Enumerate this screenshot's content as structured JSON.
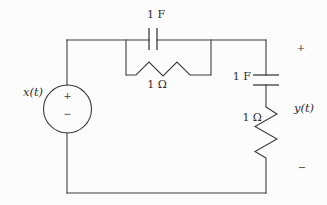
{
  "figure": {
    "kind": "circuit-diagram",
    "colors": {
      "line": "#3c3c3c",
      "background": "#fcfcfc",
      "text": "#2f2f2f"
    },
    "source": {
      "label": "x(t)",
      "plus": "+",
      "minus": "−"
    },
    "output": {
      "label": "y(t)",
      "plus": "+",
      "minus": "−"
    },
    "components": [
      {
        "id": "c1",
        "type": "capacitor",
        "label": "1 F",
        "position": "top-branch"
      },
      {
        "id": "r1",
        "type": "resistor",
        "label": "1 Ω",
        "position": "parallel-below-c1"
      },
      {
        "id": "c2",
        "type": "capacitor",
        "label": "1 F",
        "position": "right-series"
      },
      {
        "id": "r2",
        "type": "resistor",
        "label": "1 Ω",
        "position": "right-series"
      }
    ]
  }
}
